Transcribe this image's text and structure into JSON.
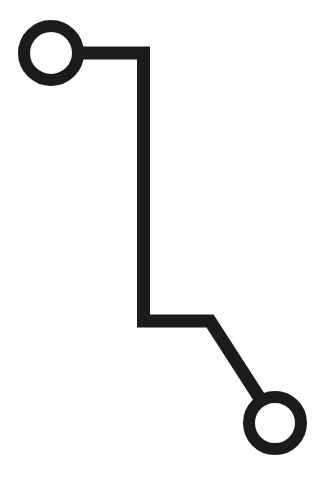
{
  "diagram": {
    "type": "circuit-trace-icon",
    "background": "#ffffff",
    "stroke_color": "#1b1b1b",
    "stroke_width": 13,
    "start_node": {
      "cx": 51,
      "cy": 53,
      "r": 27,
      "ring_width": 12
    },
    "end_node": {
      "cx": 275,
      "cy": 423,
      "r": 26,
      "ring_width": 12
    },
    "trace_points": "78,53 143.5,53 143.5,321 210,321 259,397"
  }
}
